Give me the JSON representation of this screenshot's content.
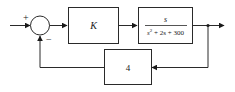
{
  "diagram": {
    "type": "block-diagram",
    "summing_junction": {
      "plus_sign": "+",
      "minus_sign": "−"
    },
    "forward_blocks": [
      {
        "id": "controller",
        "label": "K"
      },
      {
        "id": "plant",
        "numerator": "s",
        "denominator": "s² + 2s + 300",
        "denominator_parts": {
          "s": "s",
          "exp": "2",
          "rest": " + 2s + 300"
        }
      }
    ],
    "feedback_block": {
      "id": "feedback",
      "label": "4"
    },
    "colors": {
      "stroke": "#2a2a2a",
      "background": "#ffffff"
    }
  }
}
